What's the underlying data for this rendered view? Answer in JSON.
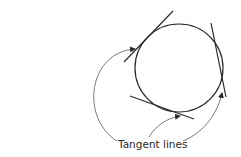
{
  "diagram": {
    "label": "Tangent lines",
    "circle": {
      "cx": 179,
      "cy": 68,
      "r": 44
    },
    "tangent_lines": [
      {
        "name": "upper-left",
        "x1": 124,
        "y1": 62,
        "x2": 173,
        "y2": 11
      },
      {
        "name": "right",
        "x1": 211,
        "y1": 23,
        "x2": 226,
        "y2": 97
      },
      {
        "name": "bottom",
        "x1": 130,
        "y1": 96,
        "x2": 194,
        "y2": 119
      }
    ],
    "colors": {
      "line": "#2a2a2a",
      "arrow": "#6a6a6a",
      "background": "#ffffff"
    }
  }
}
